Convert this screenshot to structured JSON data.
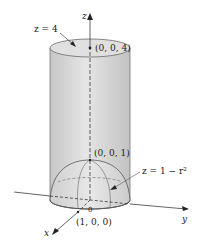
{
  "diagram": {
    "labels": {
      "top_plane": "z = 4",
      "top_point": "(0, 0, 4)",
      "paraboloid_vertex": "(0, 0, 1)",
      "paraboloid_eq": "z = 1 − r²",
      "x_intercept": "(1, 0, 0)",
      "origin": "0",
      "axis_x": "x",
      "axis_y": "y",
      "axis_z": "z"
    },
    "colors": {
      "cylinder_fill": "#d4d4d4",
      "cylinder_top": "#e2e2e2",
      "cylinder_outline": "#777777",
      "dome_fill": "#d9d9d9",
      "dome_line": "#555555",
      "axis": "#222222"
    }
  }
}
